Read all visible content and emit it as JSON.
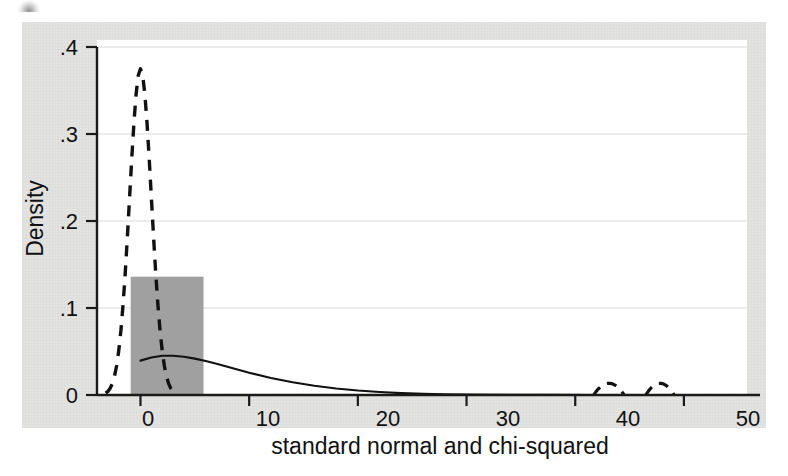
{
  "figure": {
    "kind": "statistical-density-plot",
    "caption_artifact": "",
    "background_color": "#e3e3e1",
    "plot_background_color": "#ffffff",
    "axis_color": "#1a1a1a",
    "gridline_color": "#e6e6e6",
    "histogram_fill_color": "#a0a0a0",
    "curve_color": "#111111"
  },
  "chart_data": {
    "type": "line",
    "title": "",
    "xlabel": "standard normal and chi-squared",
    "ylabel": "Density",
    "xlim": [
      -4,
      57
    ],
    "ylim": [
      0,
      0.4
    ],
    "xticks": [
      0,
      10,
      20,
      30,
      40,
      50
    ],
    "xtick_labels": [
      "0",
      "10",
      "20",
      "30",
      "40",
      "50"
    ],
    "yticks": [
      0,
      0.1,
      0.2,
      0.3,
      0.4
    ],
    "ytick_labels": [
      "0",
      ".1",
      ".2",
      ".3",
      ".4"
    ],
    "grid": "horizontal",
    "legend": "none",
    "series": [
      {
        "name": "standard normal density",
        "style": "dashed",
        "color": "#111111",
        "peak_x": 0,
        "peak_y": 0.375,
        "x": [
          -3.2,
          -3.0,
          -2.8,
          -2.6,
          -2.4,
          -2.2,
          -2.0,
          -1.8,
          -1.6,
          -1.4,
          -1.2,
          -1.0,
          -0.8,
          -0.6,
          -0.4,
          -0.2,
          0.0,
          0.2,
          0.4,
          0.6,
          0.8,
          1.0,
          1.2,
          1.4,
          1.6,
          1.8,
          2.0,
          2.2,
          2.4,
          2.6,
          2.8,
          3.0,
          3.2
        ],
        "y": [
          0.0024,
          0.0044,
          0.0079,
          0.0136,
          0.0224,
          0.0355,
          0.054,
          0.079,
          0.1109,
          0.1497,
          0.1942,
          0.242,
          0.2897,
          0.3332,
          0.3683,
          0.391,
          0.3989,
          0.391,
          0.3683,
          0.3332,
          0.2897,
          0.242,
          0.1942,
          0.1497,
          0.1109,
          0.079,
          0.054,
          0.0355,
          0.0224,
          0.0136,
          0.0079,
          0.0044,
          0.0024
        ]
      },
      {
        "name": "chi-squared density (df=4)",
        "style": "solid",
        "color": "#111111",
        "peak_x": 2.2,
        "peak_y": 0.0455,
        "x": [
          0,
          1,
          2,
          3,
          4,
          5,
          6,
          7,
          8,
          9,
          10,
          12,
          14,
          16,
          18,
          20,
          22,
          24,
          26,
          28,
          30,
          34,
          38,
          42,
          46,
          50,
          55
        ],
        "y": [
          0.0395,
          0.043,
          0.0452,
          0.0452,
          0.044,
          0.0418,
          0.039,
          0.0358,
          0.0324,
          0.029,
          0.0256,
          0.0196,
          0.0146,
          0.0106,
          0.0074,
          0.0051,
          0.0034,
          0.0022,
          0.0014,
          0.0009,
          0.0006,
          0.0002,
          0.0001,
          5e-05,
          2e-05,
          1e-05,
          5e-06
        ]
      },
      {
        "name": "far-tail dashed bumps",
        "style": "dashed",
        "color": "#111111",
        "bumps": [
          {
            "center_x": 43.1,
            "half_width": 1.4,
            "height": 0.0135
          },
          {
            "center_x": 47.8,
            "half_width": 1.3,
            "height": 0.0135
          }
        ]
      }
    ],
    "histogram": {
      "name": "sample histogram bar",
      "fill_color": "#a0a0a0",
      "bars": [
        {
          "x_start": -0.9,
          "x_end": 5.8,
          "height": 0.136
        }
      ]
    },
    "annotations": []
  },
  "axis": {
    "y_axis_name": "Density",
    "x_axis_name": "standard normal and chi-squared"
  }
}
